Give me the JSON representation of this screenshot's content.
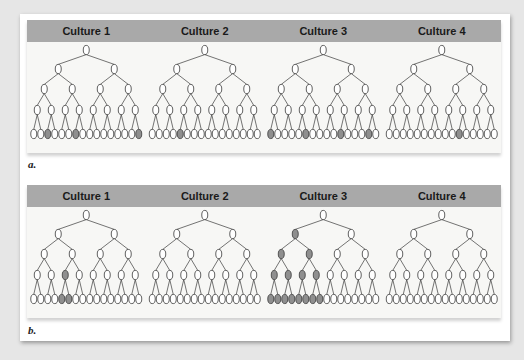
{
  "figure": {
    "panels": [
      {
        "id": "a",
        "label": "a.",
        "cultures": [
          {
            "title": "Culture 1",
            "shaded": {
              "l1": [],
              "l2": [],
              "l3": [],
              "l4": [],
              "l5": [
                2,
                6,
                15
              ]
            }
          },
          {
            "title": "Culture 2",
            "shaded": {
              "l1": [],
              "l2": [],
              "l3": [],
              "l4": [],
              "l5": [
                4
              ]
            }
          },
          {
            "title": "Culture 3",
            "shaded": {
              "l1": [],
              "l2": [],
              "l3": [],
              "l4": [],
              "l5": [
                0,
                5,
                10,
                14
              ]
            }
          },
          {
            "title": "Culture 4",
            "shaded": {
              "l1": [],
              "l2": [],
              "l3": [],
              "l4": [],
              "l5": [
                10
              ]
            }
          }
        ]
      },
      {
        "id": "b",
        "label": "b.",
        "cultures": [
          {
            "title": "Culture 1",
            "shaded": {
              "l1": [],
              "l2": [],
              "l3": [],
              "l4": [
                2
              ],
              "l5": [
                4,
                5
              ]
            }
          },
          {
            "title": "Culture 2",
            "shaded": {
              "l1": [],
              "l2": [],
              "l3": [],
              "l4": [],
              "l5": []
            }
          },
          {
            "title": "Culture 3",
            "shaded": {
              "l1": [],
              "l2": [
                0
              ],
              "l3": [
                0,
                1
              ],
              "l4": [
                0,
                1,
                2,
                3
              ],
              "l5": [
                0,
                1,
                2,
                3,
                4,
                5,
                6,
                7
              ]
            }
          },
          {
            "title": "Culture 4",
            "shaded": {
              "l1": [],
              "l2": [],
              "l3": [],
              "l4": [],
              "l5": []
            }
          }
        ]
      }
    ],
    "colors": {
      "node_fill": "#ffffff",
      "node_shaded": "#8f8f8f",
      "node_stroke": "#3a3a3a",
      "edge": "#3a3a3a",
      "header_bg": "#a9a9a9"
    }
  }
}
